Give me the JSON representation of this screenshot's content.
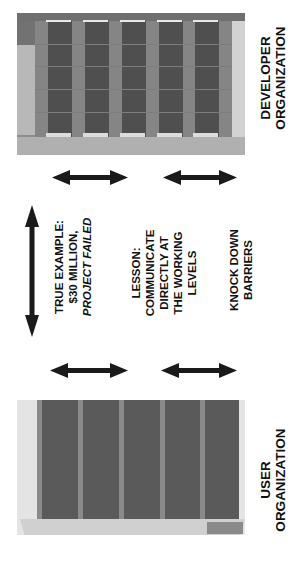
{
  "diagram": {
    "top_building": {
      "label_line1": "DEVELOPER",
      "label_line2": "ORGANIZATION",
      "label": "DEVELOPER\nORGANIZATION"
    },
    "bottom_building": {
      "label": "USER\nORGANIZATION"
    },
    "notes": [
      {
        "id": "example",
        "text": "TRUE EXAMPLE:\n$30 MILLION,",
        "italic_text": "PROJECT FAILED"
      },
      {
        "id": "lesson",
        "text": "LESSON:\nCOMMUNICATE\nDIRECTLY AT\nTHE WORKING\nLEVELS"
      },
      {
        "id": "barriers",
        "text": "KNOCK DOWN\nBARRIERS"
      }
    ],
    "arrows": [
      {
        "id": "top-left",
        "orientation": "horizontal"
      },
      {
        "id": "top-right",
        "orientation": "horizontal"
      },
      {
        "id": "vertical-left",
        "orientation": "vertical"
      },
      {
        "id": "bottom-left",
        "orientation": "horizontal"
      },
      {
        "id": "bottom-right",
        "orientation": "horizontal"
      }
    ],
    "colors": {
      "arrow": "#1a1a1a",
      "text": "#111111",
      "building_dark": "#4f4f4f",
      "building_mid": "#8e8e8e",
      "building_light": "#d2d2d2"
    }
  }
}
